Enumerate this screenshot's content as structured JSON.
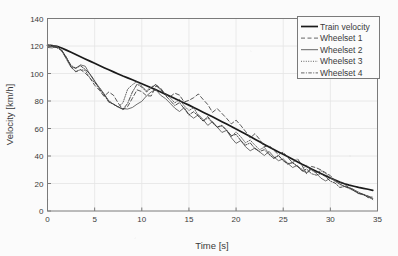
{
  "chart_data": {
    "type": "line",
    "title": "",
    "xlabel": "Time [s]",
    "ylabel": "Velocity [km/h]",
    "xlim": [
      0,
      35
    ],
    "ylim": [
      0,
      140
    ],
    "xticks": [
      0,
      5,
      10,
      15,
      20,
      25,
      30,
      35
    ],
    "yticks": [
      0,
      20,
      40,
      60,
      80,
      100,
      120,
      140
    ],
    "grid": true,
    "legend_position": "upper right",
    "legend_entries": [
      "Train velocity",
      "Wheelset 1",
      "Wheelset 2",
      "Wheelset 3",
      "Wheelset 4"
    ],
    "x": [
      0,
      0.5,
      1,
      1.5,
      2,
      2.5,
      3,
      3.5,
      4,
      4.5,
      5,
      5.5,
      6,
      6.5,
      7,
      7.5,
      8,
      8.5,
      9,
      9.5,
      10,
      10.5,
      11,
      11.5,
      12,
      12.5,
      13,
      13.5,
      14,
      14.5,
      15,
      15.5,
      16,
      16.5,
      17,
      17.5,
      18,
      18.5,
      19,
      19.5,
      20,
      20.5,
      21,
      21.5,
      22,
      22.5,
      23,
      23.5,
      24,
      24.5,
      25,
      25.5,
      26,
      26.5,
      27,
      27.5,
      28,
      28.5,
      29,
      29.5,
      30,
      30.5,
      31,
      31.5,
      32,
      32.5,
      33,
      33.5,
      34,
      34.5
    ],
    "series": [
      {
        "name": "Train velocity",
        "style": "solid-thick",
        "color": "#1a1a1a",
        "values": [
          120.5,
          120.2,
          119.8,
          118.6,
          117.0,
          115.4,
          113.8,
          112.2,
          110.6,
          109.0,
          107.4,
          105.8,
          104.2,
          102.7,
          101.2,
          99.7,
          98.2,
          96.8,
          95.4,
          94.0,
          92.6,
          91.1,
          89.6,
          88.1,
          86.6,
          85.0,
          83.4,
          81.8,
          80.2,
          78.6,
          77.0,
          75.3,
          73.6,
          71.9,
          70.2,
          68.5,
          66.8,
          65.0,
          63.2,
          61.4,
          59.6,
          57.8,
          56.0,
          54.1,
          52.2,
          50.3,
          48.4,
          46.6,
          44.8,
          43.0,
          41.2,
          39.4,
          37.6,
          35.8,
          34.0,
          32.3,
          30.6,
          28.9,
          27.2,
          25.6,
          24.0,
          22.5,
          21.0,
          19.8,
          18.8,
          18.0,
          17.2,
          16.5,
          15.8,
          15.0
        ]
      },
      {
        "name": "Wheelset 1",
        "style": "dashed",
        "color": "#3a3a3a",
        "values": [
          120.4,
          120.0,
          119.4,
          117.2,
          112.0,
          105.0,
          101.5,
          103.5,
          101.0,
          96.0,
          91.5,
          87.0,
          82.5,
          86.0,
          83.0,
          78.0,
          74.5,
          77.0,
          82.0,
          88.5,
          87.0,
          84.0,
          85.0,
          90.0,
          88.0,
          84.5,
          82.0,
          85.5,
          83.0,
          79.0,
          80.0,
          83.0,
          86.0,
          82.0,
          78.0,
          73.0,
          75.0,
          71.0,
          67.0,
          63.0,
          65.0,
          61.0,
          57.0,
          53.0,
          55.5,
          51.0,
          47.0,
          49.0,
          45.0,
          41.0,
          43.0,
          39.5,
          36.0,
          37.5,
          33.0,
          25.5,
          32.0,
          31.0,
          29.0,
          27.0,
          25.0,
          23.0,
          21.0,
          19.5,
          18.0,
          16.0,
          14.0,
          12.0,
          10.0,
          9.0
        ]
      },
      {
        "name": "Wheelset 2",
        "style": "solid-thin",
        "color": "#555555",
        "values": [
          120.3,
          119.9,
          119.2,
          116.5,
          110.5,
          104.0,
          103.0,
          105.5,
          104.5,
          100.0,
          95.0,
          90.0,
          85.5,
          81.0,
          78.0,
          76.0,
          74.5,
          73.5,
          74.0,
          77.0,
          79.0,
          83.0,
          86.5,
          88.0,
          85.0,
          82.0,
          79.0,
          76.0,
          73.0,
          75.5,
          71.5,
          68.0,
          70.0,
          66.0,
          62.0,
          64.0,
          60.0,
          56.0,
          58.0,
          54.0,
          50.0,
          52.0,
          48.0,
          44.5,
          46.5,
          43.0,
          40.0,
          42.0,
          38.5,
          35.5,
          37.0,
          34.0,
          31.0,
          33.0,
          30.0,
          28.5,
          30.5,
          28.0,
          25.0,
          22.0,
          24.0,
          21.0,
          19.0,
          17.5,
          16.0,
          14.5,
          13.0,
          11.5,
          10.0,
          8.5
        ]
      },
      {
        "name": "Wheelset 3",
        "style": "dotted",
        "color": "#4a4a4a",
        "values": [
          120.4,
          120.0,
          119.3,
          116.8,
          111.0,
          104.5,
          102.0,
          104.0,
          102.5,
          98.0,
          93.0,
          88.5,
          84.0,
          80.0,
          77.5,
          75.5,
          78.0,
          88.0,
          93.0,
          95.5,
          92.0,
          88.0,
          90.5,
          93.0,
          89.0,
          85.0,
          81.0,
          78.5,
          80.0,
          76.0,
          72.0,
          74.0,
          70.0,
          66.5,
          68.5,
          64.5,
          61.0,
          63.0,
          59.0,
          55.0,
          57.0,
          53.0,
          49.5,
          51.5,
          47.5,
          44.0,
          46.0,
          42.5,
          39.0,
          41.0,
          37.5,
          34.5,
          36.0,
          33.0,
          30.5,
          32.0,
          29.5,
          27.0,
          28.5,
          26.0,
          23.5,
          21.5,
          19.5,
          18.0,
          16.5,
          15.0,
          13.5,
          12.0,
          10.5,
          9.0
        ]
      },
      {
        "name": "Wheelset 4",
        "style": "dash-dot",
        "color": "#2f2f2f",
        "values": [
          120.4,
          120.1,
          119.5,
          117.0,
          111.5,
          105.5,
          102.5,
          105.0,
          103.0,
          99.0,
          94.0,
          89.0,
          85.0,
          80.5,
          78.5,
          76.5,
          75.0,
          79.0,
          86.0,
          91.0,
          89.0,
          86.0,
          88.0,
          91.5,
          87.5,
          83.5,
          80.5,
          77.5,
          79.5,
          75.0,
          71.0,
          73.0,
          69.0,
          65.5,
          67.5,
          63.5,
          60.0,
          62.0,
          58.0,
          54.5,
          56.0,
          52.0,
          48.5,
          50.5,
          46.5,
          43.5,
          45.0,
          41.5,
          38.0,
          40.0,
          36.5,
          33.5,
          35.0,
          32.0,
          29.0,
          31.0,
          28.5,
          26.5,
          27.5,
          25.0,
          22.5,
          20.5,
          18.5,
          17.0,
          15.5,
          14.0,
          12.5,
          11.0,
          9.5,
          8.0
        ]
      }
    ]
  },
  "axes": {
    "xlabel": "Time [s]",
    "ylabel": "Velocity [km/h]",
    "xtick_labels": [
      "0",
      "5",
      "10",
      "15",
      "20",
      "25",
      "30",
      "35"
    ],
    "ytick_labels": [
      "0",
      "20",
      "40",
      "60",
      "80",
      "100",
      "120",
      "140"
    ]
  },
  "legend": {
    "items": [
      {
        "label": "Train velocity",
        "style": "solid-thick"
      },
      {
        "label": "Wheelset 1",
        "style": "dashed"
      },
      {
        "label": "Wheelset 2",
        "style": "solid-thin"
      },
      {
        "label": "Wheelset 3",
        "style": "dotted"
      },
      {
        "label": "Wheelset 4",
        "style": "dash-dot"
      }
    ]
  },
  "colors": {
    "background": "#fbfbfb",
    "axis": "#7a7a7a",
    "grid": "#e4e4e4",
    "text": "#3a3a3a",
    "train": "#1a1a1a",
    "wheelset": "#4a4a4a"
  }
}
